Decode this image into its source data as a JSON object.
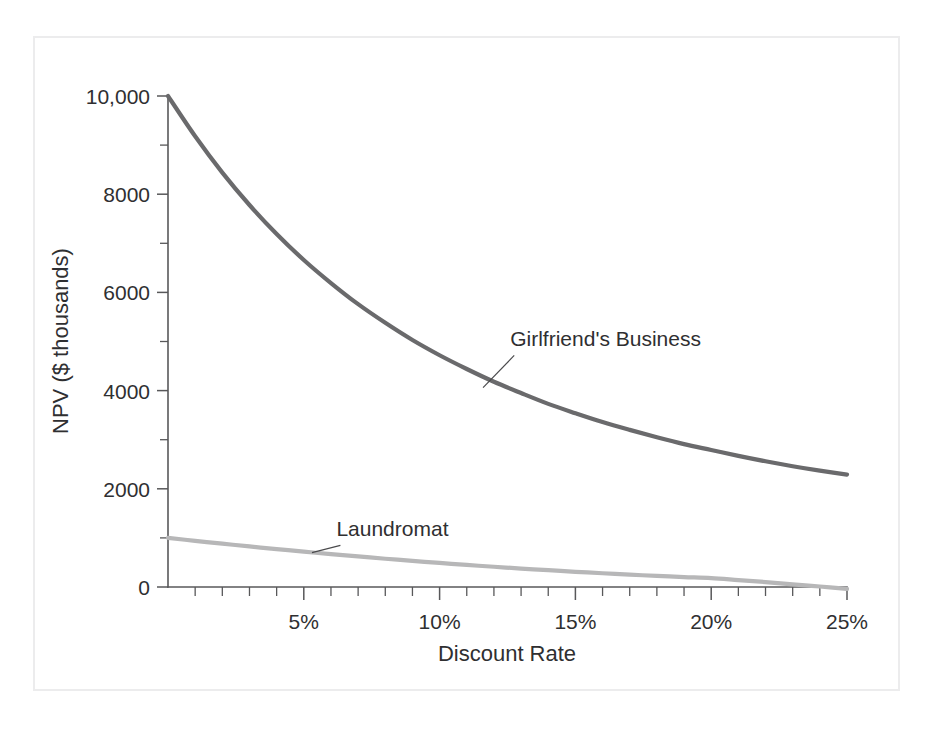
{
  "figure": {
    "background_color": "#ffffff",
    "frame_color": "#ececed"
  },
  "chart_data": {
    "type": "line",
    "title": "",
    "subtitle": "",
    "xlabel": "Discount Rate",
    "ylabel": "NPV ($ thousands)",
    "xlim": [
      0,
      25
    ],
    "ylim": [
      -400,
      10000
    ],
    "grid": false,
    "legend_position": "inline-annotations",
    "x_tick_labels": [
      "5%",
      "10%",
      "15%",
      "20%",
      "25%"
    ],
    "x_tick_values": [
      5,
      10,
      15,
      20,
      25
    ],
    "x_minor_tick_step": 1,
    "y_tick_labels": [
      "0",
      "2000",
      "4000",
      "6000",
      "8000",
      "10,000"
    ],
    "y_tick_values": [
      0,
      2000,
      4000,
      6000,
      8000,
      10000
    ],
    "y_minor_tick_step": 1000,
    "x": [
      0,
      1,
      2,
      3,
      4,
      5,
      6,
      7,
      8,
      9,
      10,
      11,
      12,
      13,
      14,
      15,
      16,
      17,
      18,
      19,
      20,
      21,
      22,
      23,
      24,
      25
    ],
    "series": [
      {
        "name": "Girlfriend's Business",
        "color": "#6a6a6c",
        "width": 4.2,
        "values": [
          10000,
          9180,
          8440,
          7780,
          7190,
          6660,
          6190,
          5760,
          5380,
          5030,
          4720,
          4440,
          4180,
          3950,
          3730,
          3540,
          3360,
          3200,
          3050,
          2910,
          2790,
          2670,
          2560,
          2460,
          2370,
          2290
        ],
        "annotation": {
          "text": "Girlfriend's Business",
          "label_x": 12.6,
          "label_y": 4900,
          "anchor_x": 11.6,
          "anchor_y": 4060
        }
      },
      {
        "name": "Laundromat",
        "color": "#b7b7b8",
        "width": 4.2,
        "values": [
          1000,
          940,
          882,
          826,
          772,
          720,
          670,
          622,
          576,
          532,
          490,
          450,
          412,
          376,
          342,
          310,
          280,
          252,
          226,
          202,
          180,
          140,
          100,
          55,
          10,
          -40
        ],
        "annotation": {
          "text": "Laundromat",
          "label_x": 6.2,
          "label_y": 1030,
          "anchor_x": 5.3,
          "anchor_y": 700
        }
      }
    ]
  }
}
